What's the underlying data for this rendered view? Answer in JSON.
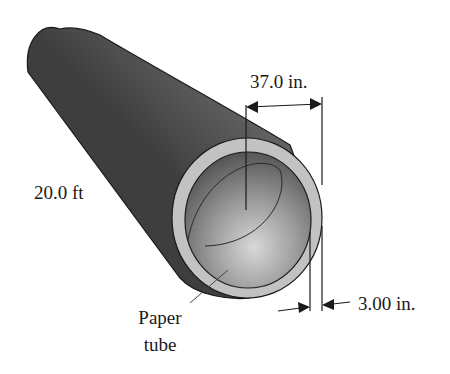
{
  "figure": {
    "labels": {
      "diameter": "37.0 in.",
      "length": "20.0 ft",
      "thickness": "3.00 in.",
      "part_line1": "Paper",
      "part_line2": "tube"
    },
    "colors": {
      "tube_dark": "#4a4a4a",
      "tube_mid": "#8a8a8a",
      "tube_light": "#c8c8c8",
      "rim": "#bdbdbd",
      "line": "#1a1a1a"
    }
  }
}
